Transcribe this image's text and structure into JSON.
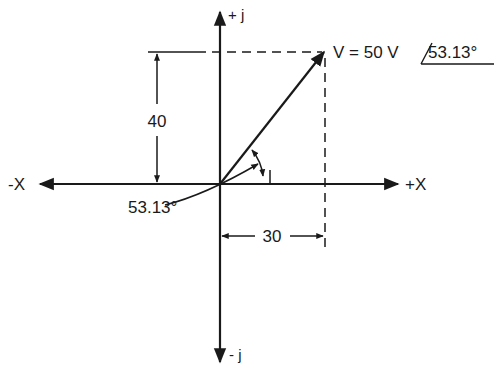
{
  "diagram": {
    "axes": {
      "pos_j": "+ j",
      "neg_j": "- j",
      "pos_x": "+X",
      "neg_x": "-X"
    },
    "vector": {
      "label": "V = 50 V",
      "angle": "53.13°",
      "magnitude": 50,
      "angle_deg": 53.13
    },
    "dimensions": {
      "vertical": "40",
      "horizontal": "30"
    },
    "angle_callout": "53.13°",
    "colors": {
      "line": "#1a1a1a",
      "background": "#ffffff"
    }
  }
}
